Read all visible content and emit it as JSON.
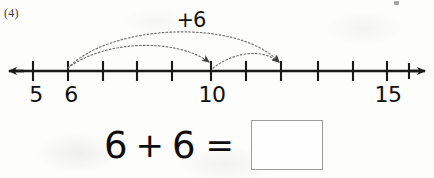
{
  "worksheet": {
    "problem_number": "(4)",
    "jump_label": "+6"
  },
  "number_line": {
    "left_arrow_icon": "arrow-left-icon",
    "right_arrow_icon": "arrow-right-icon",
    "axis_y": 71,
    "start_x": 8,
    "end_x": 425,
    "tick_spacing": 34.7,
    "first_tick_x": 33,
    "tick_count": 12,
    "tick_values": [
      5,
      6,
      7,
      8,
      9,
      10,
      11,
      12,
      13,
      14,
      15,
      16
    ],
    "visible_tick_labels": [
      {
        "value": "5",
        "x": 36
      },
      {
        "value": "6",
        "x": 71
      },
      {
        "value": "10",
        "x": 212
      },
      {
        "value": "15",
        "x": 388
      }
    ],
    "jumps": [
      {
        "name": "arc-6-to-12",
        "from_value": 6,
        "to_value": 12,
        "from_x": 68,
        "to_x": 281,
        "peak_y": 33,
        "style": "dotted",
        "arrowhead": true
      },
      {
        "name": "arc-6-to-10",
        "from_value": 6,
        "to_value": 10,
        "from_x": 68,
        "to_x": 211,
        "peak_y": 46,
        "style": "dotted",
        "arrowhead": true
      },
      {
        "name": "arc-10-to-12",
        "from_value": 10,
        "to_value": 12,
        "from_x": 213,
        "to_x": 280,
        "peak_y": 56,
        "style": "dotted",
        "arrowhead": true
      }
    ]
  },
  "equation": {
    "first_addend": "6",
    "plus_operator": "+",
    "second_addend": "6",
    "equals_operator": "=",
    "answer_value": "",
    "answer_placeholder": ""
  },
  "colors": {
    "ink": "#101010",
    "line": "#1a1a1a",
    "arc": "#6f6f6f",
    "answer_box_border": "#9c9c9c",
    "paper": "#fdfdfc"
  }
}
